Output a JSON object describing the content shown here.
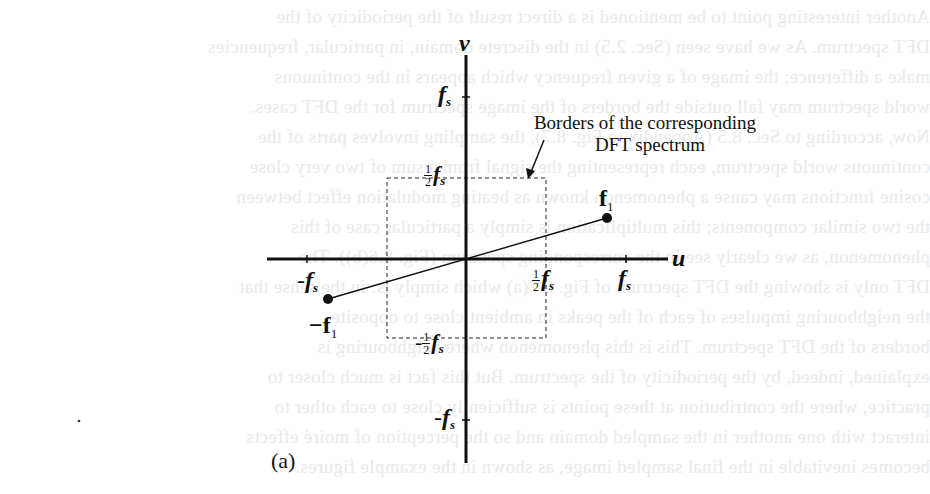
{
  "figure": {
    "caption": "(a)",
    "axes": {
      "horizontal_label": "u",
      "vertical_label": "v"
    },
    "tick_labels": {
      "u_neg_fs": {
        "prefix": "-",
        "symbol": "f",
        "sub": "s"
      },
      "u_half_fs": {
        "num": "1",
        "den": "2",
        "symbol": "f",
        "sub": "s"
      },
      "u_fs": {
        "symbol": "f",
        "sub": "s"
      },
      "v_fs": {
        "symbol": "f",
        "sub": "s"
      },
      "v_half_fs": {
        "num": "1",
        "den": "2",
        "symbol": "f",
        "sub": "s"
      },
      "v_neg_half_fs": {
        "prefix": "-",
        "num": "1",
        "den": "2",
        "symbol": "f",
        "sub": "s"
      },
      "v_neg_fs": {
        "prefix": "-",
        "symbol": "f",
        "sub": "s"
      }
    },
    "points": {
      "f1": {
        "label": "f",
        "sub": "1"
      },
      "neg_f1": {
        "prefix": "−",
        "label": "f",
        "sub": "1"
      }
    },
    "annotation": {
      "line1": "Borders of the corresponding",
      "line2": "DFT spectrum"
    },
    "colors": {
      "ink": "#111111",
      "background": "#ffffff",
      "bleed_through": "#d9d9d9"
    }
  }
}
